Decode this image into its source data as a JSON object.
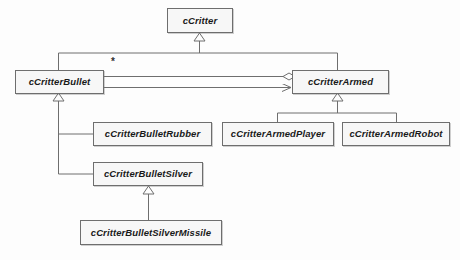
{
  "diagram": {
    "type": "uml-class-diagram",
    "background_color": "#fdfdfd",
    "line_color": "#6e6e6e",
    "box_fill_color": "#f7f7f7",
    "text_color": "#1a1a1a",
    "classes": [
      {
        "id": "cCritter",
        "label": "cCritter",
        "x": 167,
        "y": 8,
        "w": 66,
        "h": 25
      },
      {
        "id": "cCritterBullet",
        "label": "cCritterBullet",
        "x": 15,
        "y": 70,
        "w": 89,
        "h": 24
      },
      {
        "id": "cCritterArmed",
        "label": "cCritterArmed",
        "x": 292,
        "y": 70,
        "w": 97,
        "h": 24
      },
      {
        "id": "cCritterBulletRubber",
        "label": "cCritterBulletRubber",
        "x": 93,
        "y": 122,
        "w": 119,
        "h": 24
      },
      {
        "id": "cCritterArmedPlayer",
        "label": "cCritterArmedPlayer",
        "x": 222,
        "y": 122,
        "w": 112,
        "h": 24
      },
      {
        "id": "cCritterArmedRobot",
        "label": "cCritterArmedRobot",
        "x": 342,
        "y": 122,
        "w": 108,
        "h": 24
      },
      {
        "id": "cCritterBulletSilver",
        "label": "cCritterBulletSilver",
        "x": 93,
        "y": 162,
        "w": 110,
        "h": 24
      },
      {
        "id": "cCritterBulletSilverMissile",
        "label": "cCritterBulletSilverMissile",
        "x": 80,
        "y": 220,
        "w": 142,
        "h": 25
      }
    ],
    "relationships": [
      {
        "id": "bullet-inherits-critter",
        "type": "generalization",
        "from": "cCritterBullet",
        "to": "cCritter"
      },
      {
        "id": "armed-inherits-critter",
        "type": "generalization",
        "from": "cCritterArmed",
        "to": "cCritter"
      },
      {
        "id": "rubber-inherits-bullet",
        "type": "generalization",
        "from": "cCritterBulletRubber",
        "to": "cCritterBullet"
      },
      {
        "id": "silver-inherits-bullet",
        "type": "generalization",
        "from": "cCritterBulletSilver",
        "to": "cCritterBullet"
      },
      {
        "id": "missile-inherits-silver",
        "type": "generalization",
        "from": "cCritterBulletSilverMissile",
        "to": "cCritterBulletSilver"
      },
      {
        "id": "player-inherits-armed",
        "type": "generalization",
        "from": "cCritterArmedPlayer",
        "to": "cCritterArmed"
      },
      {
        "id": "robot-inherits-armed",
        "type": "generalization",
        "from": "cCritterArmedRobot",
        "to": "cCritterArmed"
      },
      {
        "id": "armed-aggregates-bullet",
        "type": "aggregation",
        "from": "cCritterArmed",
        "to": "cCritterBullet",
        "multiplicity": "*"
      },
      {
        "id": "bullet-references-armed",
        "type": "association",
        "from": "cCritterBullet",
        "to": "cCritterArmed"
      }
    ],
    "labels": {
      "multiplicity_star": "*"
    }
  }
}
